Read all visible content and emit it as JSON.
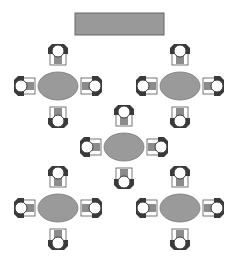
{
  "diagram": {
    "colors": {
      "head_table": "#999999",
      "table": "#9a9a9a",
      "chair_back": "#3a3a3a",
      "chair_seat": "#ffffff",
      "chair_cushion": "#8c8c8c",
      "outline": "#555555"
    },
    "head_table": {
      "label": "head-table"
    },
    "tables": [
      {
        "id": "table-1",
        "shape": "oval",
        "chairs": 4
      },
      {
        "id": "table-2",
        "shape": "oval",
        "chairs": 4
      },
      {
        "id": "table-3",
        "shape": "oval",
        "chairs": 4
      },
      {
        "id": "table-4",
        "shape": "oval",
        "chairs": 4
      },
      {
        "id": "table-5",
        "shape": "oval",
        "chairs": 4
      }
    ]
  }
}
